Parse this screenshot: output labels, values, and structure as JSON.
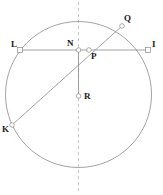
{
  "figure": {
    "name": "circle-geometry-diagram",
    "type": "geometry",
    "width": 163,
    "height": 195,
    "background_color": "#ffffff",
    "stroke_color": "#8a8a8a",
    "label_color": "#1a1a1a",
    "dash_color": "#b0a8b8"
  },
  "circle": {
    "name": "main-circle",
    "cx": 78.5,
    "cy": 94.5,
    "r": 73,
    "stroke": "#8a8a8a",
    "stroke_width": 0.8,
    "fill": "none"
  },
  "axis": {
    "name": "vertical-dashed-axis",
    "x": 78.5,
    "y1": 2,
    "y2": 193,
    "style": "dashed",
    "stroke": "#b0a8b8",
    "dash_pattern": "3 3"
  },
  "segments": [
    {
      "name": "chord-L-I",
      "from": "L",
      "to": "I",
      "x1": 20,
      "y1": 50,
      "x2": 148,
      "y2": 50,
      "style": "solid"
    },
    {
      "name": "chord-K-Q",
      "from": "K",
      "to": "Q",
      "x1": 12,
      "y1": 125,
      "x2": 122,
      "y2": 26,
      "style": "solid"
    },
    {
      "name": "segment-N-R",
      "from": "N",
      "to": "R",
      "x1": 78.5,
      "y1": 50,
      "x2": 78.5,
      "y2": 96,
      "style": "solid"
    }
  ],
  "points": [
    {
      "id": "L",
      "label": "L",
      "name": "point-L",
      "x": 20,
      "y": 50,
      "marker": "square",
      "label_dx": -9,
      "label_dy": -10
    },
    {
      "id": "I",
      "label": "I",
      "name": "point-I",
      "x": 148,
      "y": 50,
      "marker": "square",
      "label_dx": 4,
      "label_dy": -10
    },
    {
      "id": "N",
      "label": "N",
      "name": "point-N",
      "x": 78.5,
      "y": 50,
      "marker": "circle",
      "label_dx": -11,
      "label_dy": -11
    },
    {
      "id": "P",
      "label": "P",
      "name": "point-P",
      "x": 89,
      "y": 50,
      "marker": "circle",
      "label_dx": 2,
      "label_dy": 2
    },
    {
      "id": "Q",
      "label": "Q",
      "name": "point-Q",
      "x": 122,
      "y": 26,
      "marker": "circle",
      "label_dx": 2,
      "label_dy": -12
    },
    {
      "id": "K",
      "label": "K",
      "name": "point-K",
      "x": 12,
      "y": 125,
      "marker": "circle",
      "label_dx": -10,
      "label_dy": 0
    },
    {
      "id": "R",
      "label": "R",
      "name": "point-R",
      "x": 78.5,
      "y": 96,
      "marker": "circle",
      "label_dx": 5,
      "label_dy": -4
    }
  ]
}
